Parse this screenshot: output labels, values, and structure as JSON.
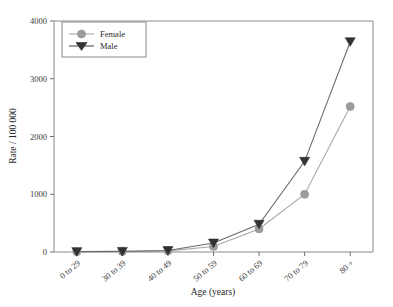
{
  "chart_data": {
    "type": "line",
    "title": "",
    "xlabel": "Age (years)",
    "ylabel": "Rate / 100 000",
    "categories": [
      "0 to 29",
      "30 to 39",
      "40 to 49",
      "50 to 59",
      "60 to 69",
      "70 to 79",
      "80 +"
    ],
    "ylim": [
      0,
      4000
    ],
    "yticks": [
      0,
      1000,
      2000,
      3000,
      4000
    ],
    "ytick_labels": [
      "0",
      "1000",
      "2000",
      "3000",
      "4000"
    ],
    "grid": false,
    "legend_position": "top-left",
    "series": [
      {
        "name": "Female",
        "marker": "circle",
        "color": "#9c9c9c",
        "values": [
          5,
          8,
          20,
          95,
          400,
          1000,
          2520
        ]
      },
      {
        "name": "Male",
        "marker": "triangle-down",
        "color": "#333333",
        "values": [
          6,
          10,
          25,
          155,
          480,
          1570,
          3640
        ]
      }
    ]
  },
  "legend": {
    "items": [
      {
        "label": "Female"
      },
      {
        "label": "Male"
      }
    ]
  },
  "axes": {
    "x_title": "Age (years)",
    "y_title": "Rate / 100 000"
  }
}
